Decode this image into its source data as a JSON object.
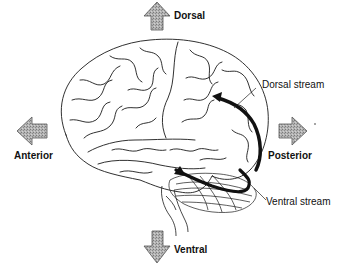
{
  "diagram": {
    "type": "brain-lateral-view-visual-streams",
    "directions": {
      "dorsal": "Dorsal",
      "ventral": "Ventral",
      "anterior": "Anterior",
      "posterior": "Posterior"
    },
    "streams": {
      "dorsal": "Dorsal stream",
      "ventral": "Ventral stream"
    },
    "colors": {
      "outline": "#1a1a1a",
      "arrow_fill": "#a8a8a8",
      "stream": "#111111",
      "background": "#ffffff"
    }
  }
}
